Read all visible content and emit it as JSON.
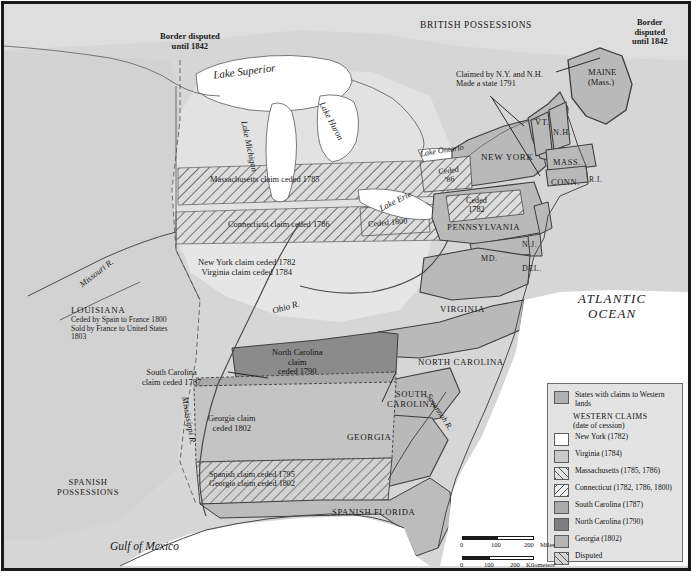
{
  "map": {
    "title": "Western Land Claims of the United States",
    "colors": {
      "ocean_bg": "#d6d6d6",
      "state_fill": "#b9b9b9",
      "ceded_fill": "#cfcfcf",
      "nc_claim": "#8b8b8b",
      "sc_claim": "#a9a9a9",
      "ga_claim": "#c2c2c2",
      "water": "#ffffff",
      "line": "#4a4a4a",
      "text": "#1a1a1a"
    },
    "labels": {
      "british_possessions": "BRITISH POSSESSIONS",
      "border_disputed_west": "Border disputed\nuntil 1842",
      "border_disputed_east": "Border\ndisputed\nuntil 1842",
      "lake_superior": "Lake Superior",
      "lake_michigan": "Lake Michigan",
      "lake_huron": "Lake Huron",
      "lake_ontario": "Lake Ontario",
      "lake_erie": "Lake Erie",
      "vermont_note": "Claimed by N.Y. and N.H.\nMade a state 1791",
      "maine": "MAINE\n(Mass.)",
      "vermont": "VT.",
      "new_hampshire": "N.H.",
      "new_york": "NEW YORK",
      "massachusetts": "MASS.",
      "connecticut": "CONN.",
      "rhode_island": "R.I.",
      "new_jersey": "N.J.",
      "pennsylvania": "PENNSYLVANIA",
      "maryland": "MD.",
      "delaware": "DEL.",
      "virginia": "VIRGINIA",
      "north_carolina": "NORTH CAROLINA",
      "south_carolina": "SOUTH\nCAROLINA",
      "georgia": "GEORGIA",
      "atlantic_ocean": "ATLANTIC\nOCEAN",
      "gulf_of_mexico": "Gulf of Mexico",
      "spanish_florida": "SPANISH FLORIDA",
      "spanish_possessions": "SPANISH\nPOSSESSIONS",
      "louisiana": "LOUISIANA",
      "louisiana_note": "Ceded by Spain to France 1800\nSold by France to United States\n1803",
      "mass_claim": "Massachusetts claim ceded 1785",
      "conn_claim": "Connecticut claim ceded 1786",
      "ceded_1800": "Ceded 1800",
      "ny_va_claims": "New York claim ceded 1782\nVirginia claim ceded 1784",
      "ceded_1782_pa": "Ceded\n1782",
      "ceded_86": "Ceded\n'86",
      "nc_claim_label": "North Carolina\nclaim\nceded 1790",
      "sc_claim_label": "South Carolina\nclaim ceded 1787",
      "ga_claim_label": "Georgia claim\nceded 1802",
      "spanish_ga_claim": "Spanish claim ceded 1795\nGeorgia claim ceded 1802",
      "missouri_r": "Missouri R.",
      "ohio_r": "Ohio R.",
      "mississippi_r": "Mississippi R.",
      "savannah_r": "Savannah R."
    }
  },
  "legend": {
    "first_entry": {
      "label": "States with claims\nto Western lands",
      "swatch": "#b0b0b0",
      "pattern": "solid"
    },
    "heading_line1": "WESTERN CLAIMS",
    "heading_line2": "(date of cession)",
    "items": [
      {
        "label": "New York (1782)",
        "swatch": "#ffffff",
        "pattern": "solid"
      },
      {
        "label": "Virginia (1784)",
        "swatch": "#c9c9c9",
        "pattern": "solid"
      },
      {
        "label": "Massachusetts\n(1785, 1786)",
        "swatch": "#e3e3e3",
        "pattern": "hatch-right"
      },
      {
        "label": "Connecticut\n(1782, 1786, 1800)",
        "swatch": "#f0f0f0",
        "pattern": "hatch-left"
      },
      {
        "label": "South Carolina (1787)",
        "swatch": "#ababab",
        "pattern": "solid"
      },
      {
        "label": "North Carolina (1790)",
        "swatch": "#7f7f7f",
        "pattern": "solid"
      },
      {
        "label": "Georgia (1802)",
        "swatch": "#b5b5b5",
        "pattern": "solid"
      },
      {
        "label": "Disputed",
        "swatch": "#d4d4d4",
        "pattern": "hatch-right"
      }
    ]
  },
  "scale": {
    "miles": {
      "ticks": [
        "0",
        "100",
        "200"
      ],
      "unit": "Miles"
    },
    "kilometers": {
      "ticks": [
        "0",
        "100",
        "200"
      ],
      "unit": "Kilometers"
    }
  }
}
